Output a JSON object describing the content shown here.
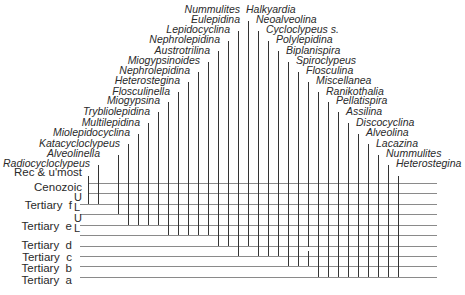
{
  "diagram": {
    "type": "stratigraphic-range-chart",
    "stages": [
      {
        "label": "Rec & u'most",
        "y": 172
      },
      {
        "label": "Cenozoic",
        "y": 187
      },
      {
        "label": "Tertiary  f",
        "y": 205
      },
      {
        "label": "Tertiary  e",
        "y": 226
      },
      {
        "label": "Tertiary  d",
        "y": 245
      },
      {
        "label": "Tertiary  c",
        "y": 257
      },
      {
        "label": "Tertiary  b",
        "y": 268
      },
      {
        "label": "Tertiary  a",
        "y": 280
      }
    ],
    "substages": [
      {
        "label": "U",
        "x": 74,
        "y": 198
      },
      {
        "label": "L",
        "x": 74,
        "y": 208
      },
      {
        "label": "U",
        "x": 74,
        "y": 219
      },
      {
        "label": "L",
        "x": 74,
        "y": 229
      }
    ],
    "horizontal_lines": [
      {
        "y": 183,
        "x1": 88
      },
      {
        "y": 193,
        "x1": 88
      },
      {
        "y": 204,
        "x1": 80
      },
      {
        "y": 214,
        "x1": 80
      },
      {
        "y": 225,
        "x1": 80
      },
      {
        "y": 235,
        "x1": 80
      },
      {
        "y": 246,
        "x1": 80
      },
      {
        "y": 256,
        "x1": 80
      },
      {
        "y": 266,
        "x1": 80
      },
      {
        "y": 277,
        "x1": 80
      }
    ],
    "line_right": 437,
    "taxa": [
      {
        "name": "Radiocycloclypeus",
        "x": 88,
        "label_y": 163,
        "top": 176,
        "bottom": 204
      },
      {
        "name": "Alveolinella",
        "x": 98,
        "label_y": 153,
        "top": 165,
        "bottom": 204
      },
      {
        "name": "Katacycloclypeus",
        "x": 118,
        "label_y": 143,
        "top": 155,
        "bottom": 214
      },
      {
        "name": "Miolepidocyclina",
        "x": 128,
        "label_y": 132,
        "top": 144,
        "bottom": 225
      },
      {
        "name": "Multilepidina",
        "x": 138,
        "label_y": 122,
        "top": 134,
        "bottom": 225
      },
      {
        "name": "Trybliolepidina",
        "x": 148,
        "label_y": 111,
        "top": 123,
        "bottom": 225
      },
      {
        "name": "Miogypsina",
        "x": 158,
        "label_y": 100,
        "top": 112,
        "bottom": 225
      },
      {
        "name": "Flosculinella",
        "x": 168,
        "label_y": 91,
        "top": 102,
        "bottom": 235
      },
      {
        "name": "Heterostegina",
        "x": 178,
        "label_y": 80,
        "top": 92,
        "bottom": 235
      },
      {
        "name": "Nephrolepidina",
        "x": 188,
        "label_y": 70,
        "top": 82,
        "bottom": 235
      },
      {
        "name": "Miogypsinoides",
        "x": 198,
        "label_y": 60,
        "top": 72,
        "bottom": 235
      },
      {
        "name": "Austrotrilina",
        "x": 208,
        "label_y": 50,
        "top": 62,
        "bottom": 235
      },
      {
        "name": "Nephrolepidina",
        "x": 218,
        "label_y": 39,
        "top": 51,
        "bottom": 246
      },
      {
        "name": "Lepidocyclina",
        "x": 228,
        "label_y": 29,
        "top": 41,
        "bottom": 246
      },
      {
        "name": "Eulepidina",
        "x": 238,
        "label_y": 19,
        "top": 31,
        "bottom": 256
      },
      {
        "name": "Nummulites",
        "x": 238,
        "label_y": 9,
        "top": 21,
        "bottom": 256,
        "skip_line": true
      },
      {
        "name": "Halkyardia",
        "x": 248,
        "label_y": 9,
        "top": 21,
        "bottom": 246,
        "label_left": true
      },
      {
        "name": "Neoalveolina",
        "x": 258,
        "label_y": 19,
        "top": 31,
        "bottom": 256,
        "label_left": true
      },
      {
        "name": "Cycloclypeus s.",
        "x": 268,
        "label_y": 29,
        "top": 41,
        "bottom": 256,
        "label_left": true
      },
      {
        "name": "Polylepidina",
        "x": 278,
        "label_y": 39,
        "top": 51,
        "bottom": 256,
        "label_left": true
      },
      {
        "name": "Biplanispira",
        "x": 288,
        "label_y": 50,
        "top": 62,
        "bottom": 266,
        "label_left": true
      },
      {
        "name": "Spiroclypeus",
        "x": 298,
        "label_y": 60,
        "top": 72,
        "bottom": 266,
        "label_left": true
      },
      {
        "name": "Flosculina",
        "x": 308,
        "label_y": 70,
        "top": 82,
        "bottom": 266,
        "label_left": true,
        "dashed": true
      },
      {
        "name": "Miscellanea",
        "x": 318,
        "label_y": 80,
        "top": 92,
        "bottom": 277,
        "label_left": true
      },
      {
        "name": "Ranikothalia",
        "x": 328,
        "label_y": 91,
        "top": 102,
        "bottom": 277,
        "label_left": true
      },
      {
        "name": "Pellatispira",
        "x": 338,
        "label_y": 100,
        "top": 112,
        "bottom": 277,
        "label_left": true
      },
      {
        "name": "Assilina",
        "x": 348,
        "label_y": 111,
        "top": 123,
        "bottom": 277,
        "label_left": true
      },
      {
        "name": "Discocyclina",
        "x": 358,
        "label_y": 122,
        "top": 134,
        "bottom": 277,
        "label_left": true
      },
      {
        "name": "Alveolina",
        "x": 368,
        "label_y": 132,
        "top": 144,
        "bottom": 277,
        "label_left": true
      },
      {
        "name": "Lacazina",
        "x": 378,
        "label_y": 143,
        "top": 155,
        "bottom": 277,
        "label_left": true
      },
      {
        "name": "Nummulites",
        "x": 388,
        "label_y": 153,
        "top": 165,
        "bottom": 277,
        "label_left": true
      },
      {
        "name": "Heterostegina",
        "x": 398,
        "label_y": 163,
        "top": 176,
        "bottom": 277,
        "label_left": true
      }
    ]
  }
}
